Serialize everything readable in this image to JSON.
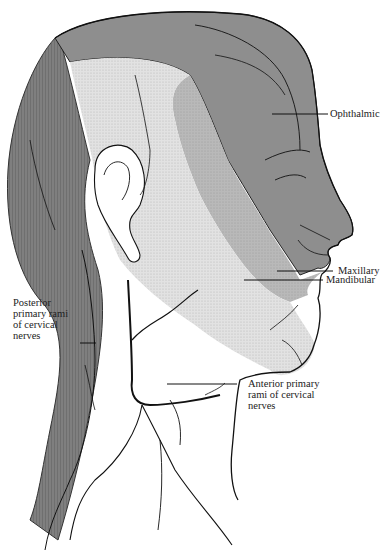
{
  "figure": {
    "colors": {
      "ophthalmic": "#8f8f8f",
      "posterior_rami": "#7d7d7d",
      "maxillary": "#b4b4b4",
      "mandibular": "#dcdcdc",
      "outline": "#111111",
      "background": "#ffffff"
    }
  },
  "labels": {
    "ophthalmic": "Ophthalmic",
    "maxillary": "Maxillary",
    "mandibular": "Mandibular",
    "posterior": [
      "Posterior",
      "primary rami",
      "of cervical",
      "nerves"
    ],
    "anterior": [
      "Anterior primary",
      "rami of cervical",
      "nerves"
    ]
  }
}
